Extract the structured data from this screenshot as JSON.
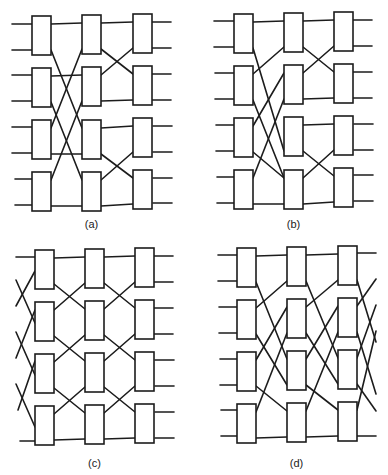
{
  "figure": {
    "panels": [
      {
        "id": "a",
        "caption": "(a)",
        "origin": [
          0,
          0
        ],
        "columns_x": [
          32,
          82,
          133
        ],
        "box_width": 19,
        "box_tops": [
          [
            16,
            68,
            120,
            172
          ],
          [
            15,
            67,
            120,
            172
          ],
          [
            14,
            66,
            118,
            170
          ]
        ],
        "box_height": 39,
        "port_offsets": [
          8,
          34
        ],
        "input_lines": [
          [
            [
              12,
              24
            ],
            [
              32,
              24
            ]
          ],
          [
            [
              12,
              50
            ],
            [
              32,
              50
            ]
          ],
          [
            [
              12,
              75
            ],
            [
              32,
              75
            ]
          ],
          [
            [
              12,
              101
            ],
            [
              32,
              101
            ]
          ],
          [
            [
              12,
              127
            ],
            [
              32,
              127
            ]
          ],
          [
            [
              12,
              153
            ],
            [
              32,
              153
            ]
          ],
          [
            [
              15,
              179
            ],
            [
              33,
              179
            ]
          ],
          [
            [
              15,
              205
            ],
            [
              33,
              205
            ]
          ]
        ],
        "output_lines": [
          [
            [
              152,
              22
            ],
            [
              171,
              22
            ]
          ],
          [
            [
              152,
              48
            ],
            [
              171,
              48
            ]
          ],
          [
            [
              152,
              74
            ],
            [
              171,
              74
            ]
          ],
          [
            [
              152,
              100
            ],
            [
              171,
              100
            ]
          ],
          [
            [
              153,
              126
            ],
            [
              172,
              126
            ]
          ],
          [
            [
              153,
              152
            ],
            [
              172,
              152
            ]
          ],
          [
            [
              153,
              178
            ],
            [
              172,
              178
            ]
          ],
          [
            [
              153,
              203
            ],
            [
              172,
              203
            ]
          ]
        ],
        "stage_links": [
          [
            [
              0,
              0,
              0,
              0
            ],
            [
              0,
              1,
              2,
              0
            ],
            [
              1,
              0,
              1,
              0
            ],
            [
              1,
              1,
              3,
              0
            ],
            [
              2,
              0,
              0,
              1
            ],
            [
              2,
              1,
              2,
              1
            ],
            [
              3,
              0,
              1,
              1
            ],
            [
              3,
              1,
              3,
              1
            ]
          ],
          [
            [
              0,
              0,
              0,
              0
            ],
            [
              0,
              1,
              1,
              0
            ],
            [
              1,
              0,
              0,
              1
            ],
            [
              1,
              1,
              1,
              1
            ],
            [
              2,
              0,
              2,
              0
            ],
            [
              2,
              1,
              3,
              0
            ],
            [
              3,
              0,
              2,
              1
            ],
            [
              3,
              1,
              3,
              1
            ]
          ]
        ]
      },
      {
        "id": "b",
        "caption": "(b)",
        "origin": [
          194,
          0
        ],
        "columns_x": [
          40,
          90,
          140
        ],
        "box_width": 19,
        "box_tops": [
          [
            14,
            66,
            118,
            170
          ],
          [
            13,
            65,
            117,
            170
          ],
          [
            12,
            64,
            116,
            168
          ]
        ],
        "box_height": 39,
        "port_offsets": [
          8,
          34
        ],
        "input_lines": [
          [
            [
              20,
              21
            ],
            [
              40,
              21
            ]
          ],
          [
            [
              20,
              47
            ],
            [
              40,
              47
            ]
          ],
          [
            [
              21,
              73
            ],
            [
              41,
              73
            ]
          ],
          [
            [
              21,
              99
            ],
            [
              41,
              99
            ]
          ],
          [
            [
              22,
              125
            ],
            [
              42,
              125
            ]
          ],
          [
            [
              22,
              151
            ],
            [
              42,
              151
            ]
          ],
          [
            [
              23,
              177
            ],
            [
              43,
              177
            ]
          ],
          [
            [
              23,
              203
            ],
            [
              43,
              203
            ]
          ]
        ],
        "output_lines": [
          [
            [
              159,
              20
            ],
            [
              178,
              20
            ]
          ],
          [
            [
              159,
              46
            ],
            [
              178,
              46
            ]
          ],
          [
            [
              159,
              72
            ],
            [
              178,
              72
            ]
          ],
          [
            [
              159,
              98
            ],
            [
              178,
              98
            ]
          ],
          [
            [
              160,
              124
            ],
            [
              179,
              124
            ]
          ],
          [
            [
              160,
              150
            ],
            [
              179,
              150
            ]
          ],
          [
            [
              160,
              175
            ],
            [
              179,
              175
            ]
          ],
          [
            [
              160,
              201
            ],
            [
              179,
              201
            ]
          ]
        ],
        "stage_links": [
          [
            [
              0,
              0,
              0,
              0
            ],
            [
              0,
              1,
              2,
              1
            ],
            [
              1,
              0,
              0,
              1
            ],
            [
              1,
              1,
              3,
              0
            ],
            [
              2,
              0,
              1,
              0
            ],
            [
              2,
              1,
              3,
              0
            ],
            [
              3,
              0,
              1,
              1
            ],
            [
              3,
              1,
              3,
              1
            ]
          ],
          [
            [
              0,
              0,
              0,
              0
            ],
            [
              0,
              1,
              1,
              0
            ],
            [
              1,
              0,
              0,
              1
            ],
            [
              1,
              1,
              1,
              1
            ],
            [
              2,
              0,
              2,
              0
            ],
            [
              2,
              1,
              3,
              0
            ],
            [
              3,
              0,
              2,
              1
            ],
            [
              3,
              1,
              3,
              1
            ]
          ]
        ]
      },
      {
        "id": "c",
        "caption": "(c)",
        "origin": [
          0,
          237
        ],
        "columns_x": [
          35,
          85,
          135
        ],
        "box_width": 19,
        "box_tops": [
          [
            13,
            65,
            117,
            169
          ],
          [
            12,
            64,
            116,
            168
          ],
          [
            11,
            63,
            115,
            167
          ]
        ],
        "box_height": 39,
        "port_offsets": [
          8,
          34
        ],
        "input_lines": [
          [
            [
              16,
              20
            ],
            [
              35,
              20
            ]
          ],
          [
            [
              16,
              43
            ],
            [
              35,
              86
            ]
          ],
          [
            [
              16,
              69
            ],
            [
              35,
              34
            ]
          ],
          [
            [
              16,
              95
            ],
            [
              35,
              138
            ]
          ],
          [
            [
              16,
              121
            ],
            [
              35,
              73
            ]
          ],
          [
            [
              16,
              147
            ],
            [
              35,
              190
            ]
          ],
          [
            [
              18,
              173
            ],
            [
              35,
              124
            ]
          ],
          [
            [
              20,
              204
            ],
            [
              37,
              204
            ]
          ]
        ],
        "output_lines": [
          [
            [
              154,
              19
            ],
            [
              173,
              19
            ]
          ],
          [
            [
              154,
              45
            ],
            [
              173,
              45
            ]
          ],
          [
            [
              154,
              71
            ],
            [
              173,
              71
            ]
          ],
          [
            [
              154,
              97
            ],
            [
              173,
              97
            ]
          ],
          [
            [
              155,
              123
            ],
            [
              174,
              123
            ]
          ],
          [
            [
              155,
              149
            ],
            [
              174,
              149
            ]
          ],
          [
            [
              155,
              175
            ],
            [
              174,
              175
            ]
          ],
          [
            [
              155,
              201
            ],
            [
              174,
              201
            ]
          ]
        ],
        "stage_links": [
          [
            [
              0,
              0,
              0,
              0
            ],
            [
              0,
              1,
              1,
              0
            ],
            [
              1,
              0,
              0,
              1
            ],
            [
              1,
              1,
              2,
              0
            ],
            [
              2,
              0,
              1,
              1
            ],
            [
              2,
              1,
              3,
              0
            ],
            [
              3,
              0,
              2,
              1
            ],
            [
              3,
              1,
              3,
              1
            ]
          ],
          [
            [
              0,
              0,
              0,
              0
            ],
            [
              0,
              1,
              1,
              0
            ],
            [
              1,
              0,
              0,
              1
            ],
            [
              1,
              1,
              2,
              0
            ],
            [
              2,
              0,
              1,
              1
            ],
            [
              2,
              1,
              3,
              0
            ],
            [
              3,
              0,
              2,
              1
            ],
            [
              3,
              1,
              3,
              1
            ]
          ]
        ]
      },
      {
        "id": "d",
        "caption": "(d)",
        "origin": [
          194,
          237
        ],
        "columns_x": [
          43,
          93,
          144
        ],
        "box_width": 19,
        "box_tops": [
          [
            11,
            63,
            115,
            167
          ],
          [
            10,
            62,
            114,
            166
          ],
          [
            9,
            61,
            113,
            165
          ]
        ],
        "box_height": 39,
        "port_offsets": [
          8,
          34
        ],
        "input_lines": [
          [
            [
              24,
              18
            ],
            [
              43,
              18
            ]
          ],
          [
            [
              24,
              44
            ],
            [
              43,
              44
            ]
          ],
          [
            [
              25,
              70
            ],
            [
              44,
              70
            ]
          ],
          [
            [
              25,
              96
            ],
            [
              44,
              96
            ]
          ],
          [
            [
              26,
              122
            ],
            [
              45,
              122
            ]
          ],
          [
            [
              26,
              148
            ],
            [
              45,
              148
            ]
          ],
          [
            [
              27,
              173
            ],
            [
              46,
              173
            ]
          ],
          [
            [
              27,
              199
            ],
            [
              46,
              199
            ]
          ]
        ],
        "output_lines": [
          [
            [
              163,
              16
            ],
            [
              182,
              16
            ]
          ],
          [
            [
              163,
              43
            ],
            [
              182,
              105
            ]
          ],
          [
            [
              163,
              69
            ],
            [
              182,
              42
            ]
          ],
          [
            [
              163,
              95
            ],
            [
              182,
              157
            ]
          ],
          [
            [
              163,
              121
            ],
            [
              182,
              68
            ]
          ],
          [
            [
              163,
              147
            ],
            [
              182,
              174
            ]
          ],
          [
            [
              163,
              173
            ],
            [
              182,
              94
            ]
          ],
          [
            [
              163,
              199
            ],
            [
              182,
              199
            ]
          ]
        ],
        "stage_links": [
          [
            [
              0,
              0,
              0,
              0
            ],
            [
              0,
              1,
              2,
              0
            ],
            [
              1,
              0,
              0,
              1
            ],
            [
              1,
              1,
              2,
              1
            ],
            [
              2,
              0,
              1,
              0
            ],
            [
              2,
              1,
              3,
              0
            ],
            [
              3,
              0,
              1,
              1
            ],
            [
              3,
              1,
              3,
              1
            ]
          ],
          [
            [
              0,
              0,
              0,
              0
            ],
            [
              0,
              1,
              2,
              0
            ],
            [
              1,
              0,
              0,
              1
            ],
            [
              1,
              1,
              2,
              1
            ],
            [
              2,
              0,
              1,
              0
            ],
            [
              2,
              1,
              3,
              0
            ],
            [
              3,
              0,
              1,
              1
            ],
            [
              3,
              1,
              3,
              1
            ]
          ]
        ]
      }
    ]
  },
  "colors": {
    "stroke": "#1c1c1c",
    "background": "#ffffff"
  }
}
